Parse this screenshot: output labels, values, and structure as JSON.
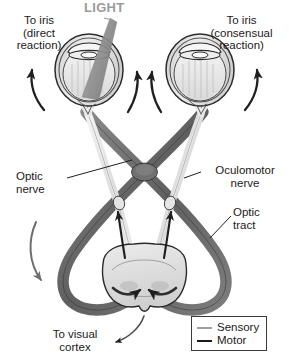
{
  "figure": {
    "type": "anatomical-diagram"
  },
  "labels": {
    "light": "LIGHT",
    "to_iris_direct": "To iris\n(direct\nreaction)",
    "to_iris_consensual": "To iris\n(consensual\nreaction)",
    "optic_nerve": "Optic\nnerve",
    "oculomotor_nerve": "Oculomotor\nnerve",
    "optic_tract": "Optic\ntract",
    "to_visual_cortex": "To visual\ncortex"
  },
  "legend": {
    "items": [
      {
        "label": "Sensory",
        "color": "#9d9d9d"
      },
      {
        "label": "Motor",
        "color": "#1a1a1a"
      }
    ]
  },
  "colors": {
    "light_beam": "#8a8a8a",
    "light_text": "#9b9b9b",
    "sensory_pathway": "#6e6e6e",
    "motor_pathway": "#d8d8d8",
    "outline": "#2b2b2b",
    "eye_fill": "#e8e8e8",
    "brainstem_fill": "#dcdcdc",
    "text": "#1a1a1a",
    "background": "#ffffff"
  },
  "structures": [
    {
      "name": "left-eye",
      "side": "left",
      "receives_light": true
    },
    {
      "name": "right-eye",
      "side": "right",
      "receives_light": false
    },
    {
      "name": "optic-chiasm",
      "side": "center"
    },
    {
      "name": "midbrain",
      "side": "center"
    }
  ],
  "arrows": [
    {
      "name": "left-outer-iris-arrow",
      "direction": "up"
    },
    {
      "name": "left-inner-iris-arrow",
      "direction": "up"
    },
    {
      "name": "right-inner-iris-arrow",
      "direction": "up"
    },
    {
      "name": "right-outer-iris-arrow",
      "direction": "up"
    },
    {
      "name": "left-optic-tract-arrow",
      "direction": "down"
    },
    {
      "name": "center-left-ascending-arrow",
      "direction": "up"
    },
    {
      "name": "center-right-ascending-arrow",
      "direction": "up"
    },
    {
      "name": "visual-cortex-arrow",
      "direction": "down-left"
    }
  ]
}
